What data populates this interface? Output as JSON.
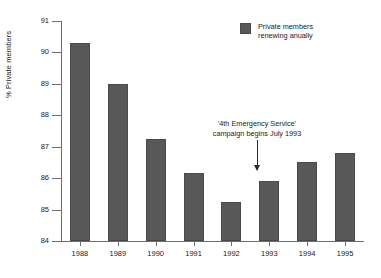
{
  "chart_data": {
    "type": "bar",
    "title": "",
    "xlabel": "",
    "ylabel": "% Private members",
    "categories": [
      "1988",
      "1989",
      "1990",
      "1991",
      "1992",
      "1993",
      "1994",
      "1995"
    ],
    "values": [
      90.3,
      89.0,
      87.25,
      86.15,
      85.25,
      85.9,
      86.5,
      86.8
    ],
    "series": [
      {
        "name": "Private members renewing anually",
        "values": [
          90.3,
          89.0,
          87.25,
          86.15,
          85.25,
          85.9,
          86.5,
          86.8
        ]
      }
    ],
    "ylim": [
      84,
      91
    ],
    "ytick_labels": [
      "84",
      "85",
      "86",
      "87",
      "88",
      "89",
      "90",
      "91"
    ],
    "ytick_values": [
      84,
      85,
      86,
      87,
      88,
      89,
      90,
      91
    ],
    "grid": false,
    "legend_position": "top-right",
    "bar_color": "#585858",
    "axis_color": "#6e6e6e"
  },
  "legend": {
    "line1": "Private members",
    "line2": "renewing anually"
  },
  "annotation": {
    "line1": "'4th Emergency Service'",
    "line2": "campaign begins July 1993",
    "target_category": "1993"
  }
}
